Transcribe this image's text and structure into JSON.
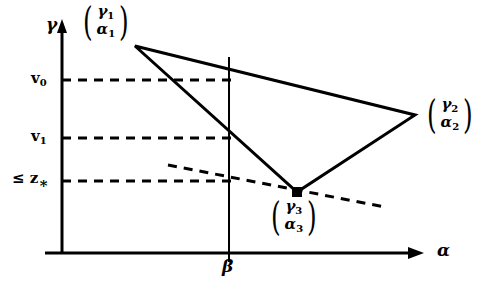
{
  "figure": {
    "type": "geometric-diagram",
    "background": "#ffffff",
    "stroke_color": "#000000",
    "width": 489,
    "height": 294
  },
  "axes": {
    "y_axis_label": "γ",
    "x_axis_label": "α",
    "origin": {
      "x": 62,
      "y": 253
    },
    "y_axis_top": 22,
    "x_axis_right": 425
  },
  "ticks": {
    "y": [
      {
        "label": "v",
        "sub": "0",
        "y": 80
      },
      {
        "label": "v",
        "sub": "1",
        "y": 138
      },
      {
        "label": "≤ z",
        "sub": "∗",
        "y": 181
      }
    ],
    "x": [
      {
        "label": "β",
        "x": 229
      }
    ]
  },
  "points": [
    {
      "name": "vertex-1",
      "top_symbol": "γ",
      "top_sub": "1",
      "bottom_symbol": "α",
      "bottom_sub": "1",
      "x": 135,
      "y": 46,
      "label_x": 80,
      "label_y": 3,
      "marker": false
    },
    {
      "name": "vertex-2",
      "top_symbol": "γ",
      "top_sub": "2",
      "bottom_symbol": "α",
      "bottom_sub": "2",
      "x": 415,
      "y": 115,
      "label_x": 424,
      "label_y": 96,
      "marker": false
    },
    {
      "name": "vertex-3",
      "top_symbol": "γ",
      "top_sub": "3",
      "bottom_symbol": "α",
      "bottom_sub": "3",
      "x": 297,
      "y": 192,
      "label_x": 268,
      "label_y": 198,
      "marker": true
    }
  ],
  "triangle": {
    "points": "135,46 415,115 297,192",
    "stroke_width": 3
  },
  "vertical_line": {
    "x": 229,
    "y_top": 57,
    "y_bottom": 253
  },
  "dashed_horizontals": [
    {
      "name": "v0-guide",
      "y": 80,
      "x_start": 62,
      "x_end": 232
    },
    {
      "name": "v1-guide",
      "y": 138,
      "x_start": 62,
      "x_end": 232
    },
    {
      "name": "zstar-guide",
      "y": 181,
      "x_start": 62,
      "x_end": 232
    }
  ],
  "dashed_sloped_line": {
    "name": "supporting-line",
    "x1": 168,
    "y1": 165,
    "x2": 385,
    "y2": 207
  }
}
